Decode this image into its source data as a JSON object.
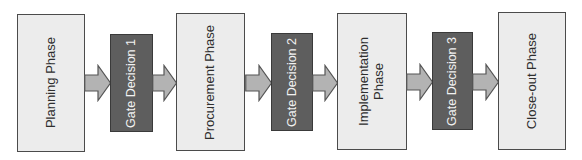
{
  "diagram": {
    "type": "process-flow",
    "colors": {
      "phase_fill": "#ececec",
      "phase_border": "#4b4b4b",
      "gate_fill": "#5e5e5e",
      "gate_border": "#3a3a3a",
      "gate_text": "#f2f2f2",
      "arrow_fill": "#b3b3b3",
      "arrow_border": "#555555"
    },
    "steps": [
      {
        "kind": "phase",
        "label": "Planning Phase"
      },
      {
        "kind": "gate",
        "label": "Gate Decision 1"
      },
      {
        "kind": "phase",
        "label": "Procurement Phase"
      },
      {
        "kind": "gate",
        "label": "Gate Decision 2"
      },
      {
        "kind": "phase",
        "label": "Implementation\nPhase"
      },
      {
        "kind": "gate",
        "label": "Gate Decision 3"
      },
      {
        "kind": "phase",
        "label": "Close-out Phase"
      }
    ],
    "connectors": [
      {
        "from": "Planning Phase",
        "to": "Gate Decision 1",
        "icon": "right-arrow-icon"
      },
      {
        "from": "Gate Decision 1",
        "to": "Procurement Phase",
        "icon": "right-arrow-icon"
      },
      {
        "from": "Procurement Phase",
        "to": "Gate Decision 2",
        "icon": "right-arrow-icon"
      },
      {
        "from": "Gate Decision 2",
        "to": "Implementation Phase",
        "icon": "right-arrow-icon"
      },
      {
        "from": "Implementation Phase",
        "to": "Gate Decision 3",
        "icon": "right-arrow-icon"
      },
      {
        "from": "Gate Decision 3",
        "to": "Close-out Phase",
        "icon": "right-arrow-icon"
      }
    ]
  }
}
